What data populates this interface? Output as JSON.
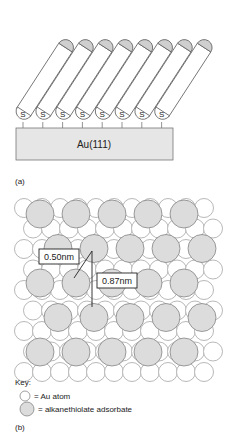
{
  "panel_a": {
    "caption": "(a)",
    "substrate_label": "Au(111)",
    "molecule_count": 8,
    "headgroup_label": "S",
    "colors": {
      "substrate": "#e6e6e6",
      "tail_cap": "#cfcfcf",
      "outline": "#666666"
    }
  },
  "panel_b": {
    "caption": "(b)",
    "distance_1": "0.50nm",
    "distance_2": "0.87nm",
    "key": {
      "title": "Key:",
      "items": [
        {
          "symbol": "open-circle",
          "label": "= Au atom"
        },
        {
          "symbol": "grey-circle",
          "label": "= alkanethiolate adsorbate"
        }
      ]
    },
    "colors": {
      "adsorbate": "#dcdcdc",
      "au_atom": "#ffffff",
      "outline": "#777777"
    }
  }
}
